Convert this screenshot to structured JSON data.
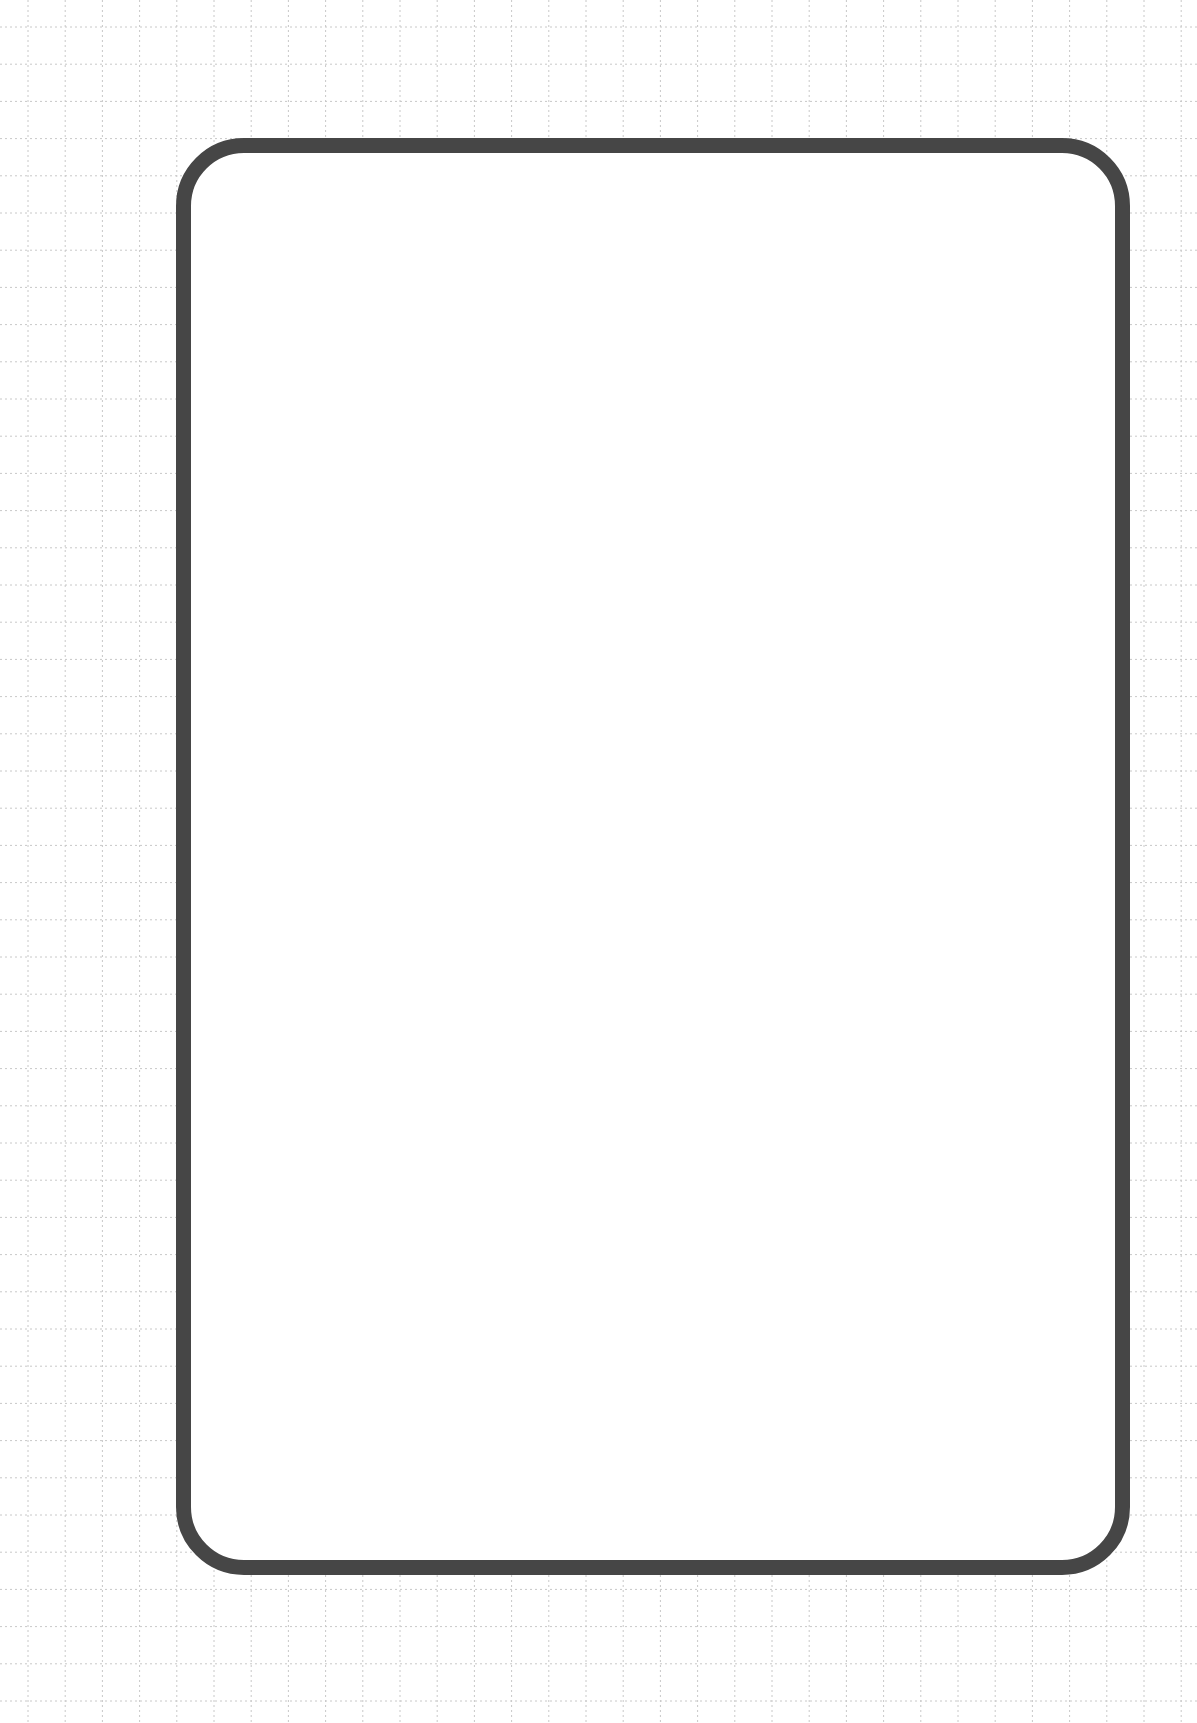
{
  "page": {
    "colors": {
      "frame_border": "#464646",
      "frame_fill": "#ffffff",
      "background": "#ffffff",
      "grid_line": "#c8c8c8"
    },
    "frame": {
      "content": ""
    }
  }
}
